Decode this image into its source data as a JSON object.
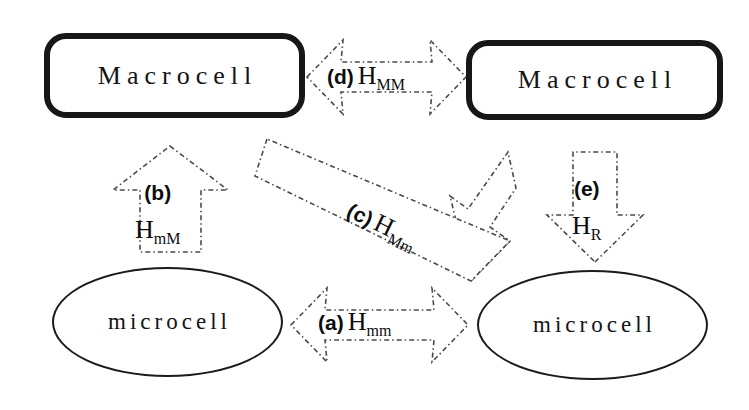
{
  "diagram": {
    "background_color": "#ffffff",
    "ink_color": "#141414",
    "arrow_stroke_color": "#4a4a4a",
    "nodes": [
      {
        "id": "macro-left",
        "label": "Macrocell",
        "shape": "rounded-rectangle",
        "x": 44,
        "y": 33,
        "width": 261,
        "height": 85
      },
      {
        "id": "macro-right",
        "label": "Macrocell",
        "shape": "rounded-rectangle",
        "x": 466,
        "y": 40,
        "width": 257,
        "height": 80
      },
      {
        "id": "micro-left",
        "label": "microcell",
        "shape": "ellipse",
        "x": 52,
        "y": 267,
        "width": 231,
        "height": 110
      },
      {
        "id": "micro-right",
        "label": "microcell",
        "shape": "ellipse",
        "x": 477,
        "y": 270,
        "width": 231,
        "height": 110
      }
    ],
    "edges": [
      {
        "id": "a",
        "tag": "(a)",
        "symbol": "H",
        "subscript": "mm",
        "from": "micro-left",
        "to": "micro-right",
        "arrow_type": "double-headed-horizontal",
        "label_x": 318,
        "label_y": 308
      },
      {
        "id": "b",
        "tag": "(b)",
        "symbol": "H",
        "subscript": "mM",
        "from": "micro-left",
        "to": "macro-left",
        "arrow_type": "single-headed-up",
        "label_x": 135,
        "label_y": 182
      },
      {
        "id": "c",
        "tag": "(c)",
        "symbol": "H",
        "subscript": "Mm",
        "from": "macro-left",
        "to": "micro-right",
        "arrow_type": "single-headed-diagonal-down-right",
        "label_x": 355,
        "label_y": 196
      },
      {
        "id": "d",
        "tag": "(d)",
        "symbol": "H",
        "subscript": "MM",
        "from": "macro-left",
        "to": "macro-right",
        "arrow_type": "double-headed-horizontal",
        "label_x": 327,
        "label_y": 62
      },
      {
        "id": "e",
        "tag": "(e)",
        "symbol": "H",
        "subscript": "R",
        "from": "macro-right",
        "to": "micro-right",
        "arrow_type": "single-headed-down",
        "label_x": 572,
        "label_y": 178
      }
    ]
  }
}
